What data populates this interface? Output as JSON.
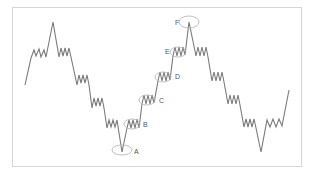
{
  "diagram": {
    "title": "",
    "colors": {
      "line": "#7a7a7a",
      "ellipse": "#b8b8b8",
      "label": "#555555",
      "frame": "#d6d6d6",
      "background": "#ffffff"
    },
    "markers": [
      {
        "id": "A",
        "label": "A",
        "cx": 122,
        "cy": 150,
        "rx": 10,
        "ry": 5,
        "label_x": 134,
        "label_y": 154
      },
      {
        "id": "B",
        "label": "B",
        "cx": 132,
        "cy": 124,
        "rx": 8,
        "ry": 5,
        "label_x": 143,
        "label_y": 127
      },
      {
        "id": "C",
        "label": "C",
        "cx": 147,
        "cy": 100,
        "rx": 8,
        "ry": 5,
        "label_x": 159,
        "label_y": 103
      },
      {
        "id": "D",
        "label": "D",
        "cx": 163,
        "cy": 77,
        "rx": 8,
        "ry": 5,
        "label_x": 175,
        "label_y": 79
      },
      {
        "id": "E",
        "label": "E",
        "cx": 178,
        "cy": 52,
        "rx": 8,
        "ry": 5,
        "label_x": 165,
        "label_y": 54
      },
      {
        "id": "F",
        "label": "F",
        "cx": 189,
        "cy": 22,
        "rx": 10,
        "ry": 6,
        "label_x": 175,
        "label_y": 25
      }
    ],
    "wave_points": [
      [
        25,
        85
      ],
      [
        31,
        58
      ],
      [
        34,
        50
      ],
      [
        36,
        56
      ],
      [
        39,
        49
      ],
      [
        41,
        57
      ],
      [
        44,
        50
      ],
      [
        46,
        57
      ],
      [
        53,
        22
      ],
      [
        59,
        57
      ],
      [
        61,
        48
      ],
      [
        63,
        56
      ],
      [
        65,
        48
      ],
      [
        67,
        56
      ],
      [
        69,
        48
      ],
      [
        71,
        57
      ],
      [
        77,
        85
      ],
      [
        79,
        75
      ],
      [
        81,
        83
      ],
      [
        83,
        75
      ],
      [
        85,
        83
      ],
      [
        87,
        75
      ],
      [
        89,
        85
      ],
      [
        92,
        108
      ],
      [
        94,
        98
      ],
      [
        96,
        106
      ],
      [
        98,
        98
      ],
      [
        100,
        106
      ],
      [
        102,
        98
      ],
      [
        104,
        108
      ],
      [
        107,
        128
      ],
      [
        109,
        120
      ],
      [
        111,
        127
      ],
      [
        113,
        120
      ],
      [
        115,
        127
      ],
      [
        117,
        120
      ],
      [
        122,
        152
      ],
      [
        127,
        128
      ],
      [
        129,
        120
      ],
      [
        131,
        128
      ],
      [
        133,
        120
      ],
      [
        135,
        128
      ],
      [
        137,
        119
      ],
      [
        139,
        128
      ],
      [
        142,
        104
      ],
      [
        144,
        95
      ],
      [
        146,
        104
      ],
      [
        148,
        95
      ],
      [
        150,
        104
      ],
      [
        152,
        95
      ],
      [
        154,
        103
      ],
      [
        158,
        81
      ],
      [
        160,
        72
      ],
      [
        162,
        81
      ],
      [
        164,
        72
      ],
      [
        166,
        81
      ],
      [
        168,
        72
      ],
      [
        170,
        80
      ],
      [
        173,
        56
      ],
      [
        175,
        47
      ],
      [
        177,
        56
      ],
      [
        179,
        47
      ],
      [
        181,
        56
      ],
      [
        183,
        47
      ],
      [
        185,
        55
      ],
      [
        189,
        22
      ],
      [
        196,
        56
      ],
      [
        198,
        47
      ],
      [
        200,
        56
      ],
      [
        202,
        47
      ],
      [
        204,
        56
      ],
      [
        206,
        47
      ],
      [
        208,
        57
      ],
      [
        212,
        81
      ],
      [
        214,
        72
      ],
      [
        216,
        81
      ],
      [
        218,
        72
      ],
      [
        220,
        81
      ],
      [
        222,
        72
      ],
      [
        224,
        82
      ],
      [
        228,
        104
      ],
      [
        230,
        95
      ],
      [
        232,
        104
      ],
      [
        234,
        95
      ],
      [
        236,
        104
      ],
      [
        238,
        95
      ],
      [
        240,
        105
      ],
      [
        244,
        127
      ],
      [
        246,
        119
      ],
      [
        248,
        127
      ],
      [
        250,
        119
      ],
      [
        252,
        127
      ],
      [
        254,
        119
      ],
      [
        256,
        128
      ],
      [
        261,
        152
      ],
      [
        267,
        120
      ],
      [
        270,
        127
      ],
      [
        273,
        119
      ],
      [
        276,
        127
      ],
      [
        279,
        119
      ],
      [
        282,
        126
      ],
      [
        289,
        90
      ]
    ]
  }
}
